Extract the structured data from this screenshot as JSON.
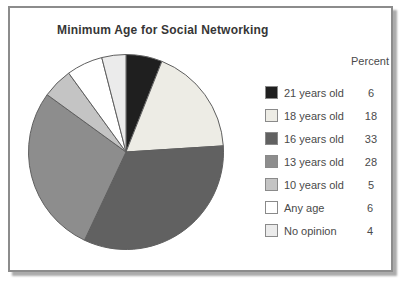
{
  "window": {
    "background": "#ffffff"
  },
  "card": {
    "background": "#ffffff",
    "border_color": "#8c8c8c",
    "shadow_color": "#ababab"
  },
  "chart_data": {
    "type": "pie",
    "title": "Minimum Age for Social Networking",
    "legend_position": "right",
    "legend_value_header": "Percent",
    "start_angle_deg": 0,
    "direction": "clockwise",
    "outline_color": "#5f5f5f",
    "slices": [
      {
        "label": "21 years old",
        "value": 6,
        "color": "#1f1f1f"
      },
      {
        "label": "18 years old",
        "value": 18,
        "color": "#edece5"
      },
      {
        "label": "16 years old",
        "value": 33,
        "color": "#616161"
      },
      {
        "label": "13 years old",
        "value": 28,
        "color": "#8d8d8d"
      },
      {
        "label": "10 years old",
        "value": 5,
        "color": "#c4c4c4"
      },
      {
        "label": "Any age",
        "value": 6,
        "color": "#ffffff"
      },
      {
        "label": "No opinion",
        "value": 4,
        "color": "#ebebeb"
      }
    ]
  }
}
